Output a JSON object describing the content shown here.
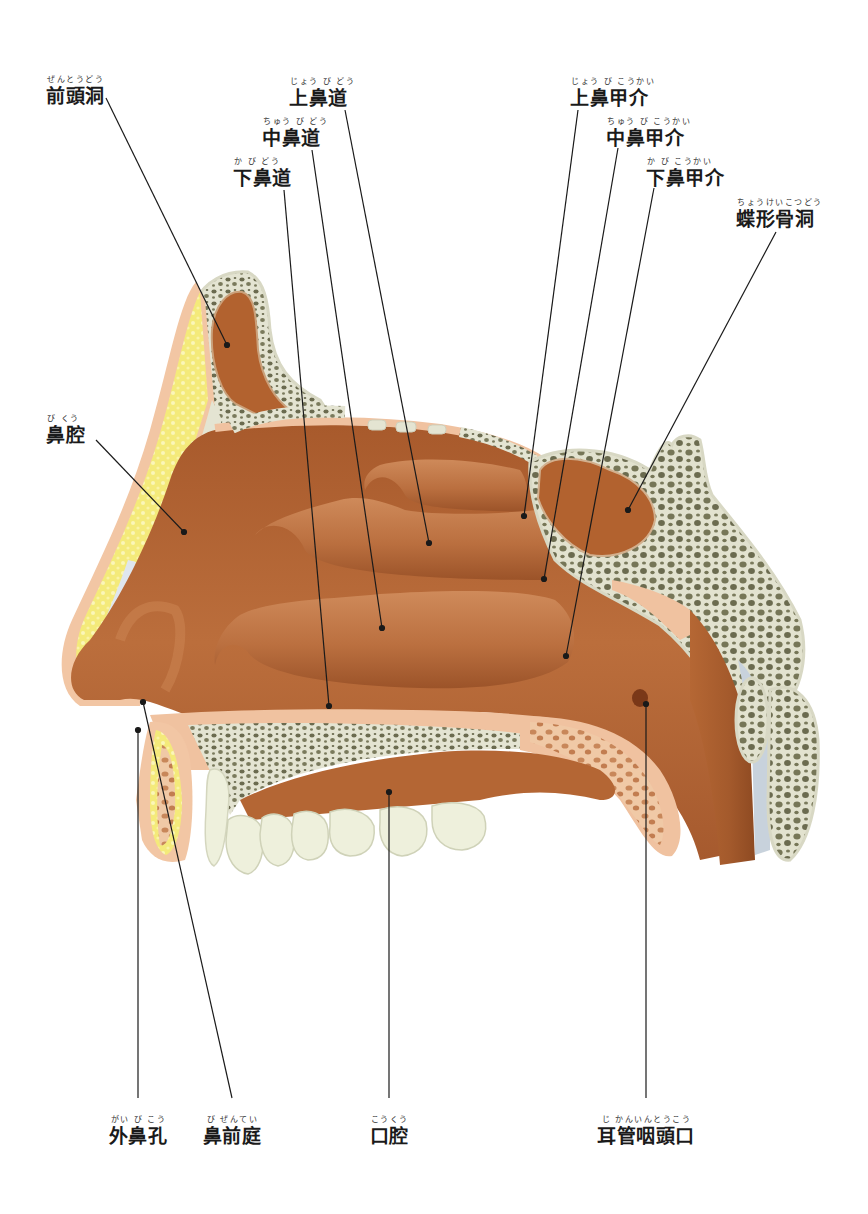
{
  "diagram": {
    "colors": {
      "mucosa": "#b8693a",
      "mucosa_dark": "#9a5428",
      "mucosa_light": "#d8976a",
      "periosteum": "#f0c2a0",
      "bone_cortex": "#e4e4d2",
      "bone_cancellous": "#6b6b4f",
      "fat": "#f2e66a",
      "skin": "#f2c6a4",
      "teeth": "#eef0dc",
      "leader_line": "#1a1a1a"
    }
  },
  "labels": {
    "frontal_sinus": {
      "ruby": "ぜんとうどう",
      "text": "前頭洞"
    },
    "superior_meatus": {
      "ruby": "じょう び どう",
      "text": "上鼻道"
    },
    "middle_meatus": {
      "ruby": "ちゅう び どう",
      "text": "中鼻道"
    },
    "inferior_meatus": {
      "ruby": "か  び どう",
      "text": "下鼻道"
    },
    "superior_concha": {
      "ruby": "じょう び  こうかい",
      "text": "上鼻甲介"
    },
    "middle_concha": {
      "ruby": "ちゅう び  こうかい",
      "text": "中鼻甲介"
    },
    "inferior_concha": {
      "ruby": "か  び  こうかい",
      "text": "下鼻甲介"
    },
    "sphenoid_sinus": {
      "ruby": "ちょうけいこつどう",
      "text": "蝶形骨洞"
    },
    "nasal_cavity": {
      "ruby": "び くう",
      "text": "鼻腔"
    },
    "nostril": {
      "ruby": "がい び  こう",
      "text": "外鼻孔"
    },
    "nasal_vestibule": {
      "ruby": "び  ぜんてい",
      "text": "鼻前庭"
    },
    "oral_cavity": {
      "ruby": "こうくう",
      "text": "口腔"
    },
    "eustachian_opening": {
      "ruby": "じ  かんいんとうこう",
      "text": "耳管咽頭口"
    }
  }
}
